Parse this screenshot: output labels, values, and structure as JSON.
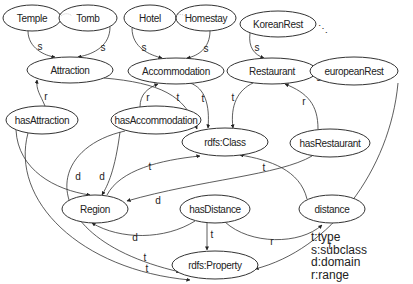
{
  "diagram": {
    "type": "rdf-ontology-graph",
    "nodes": [
      {
        "id": "temple",
        "label": "Temple",
        "cx": 32,
        "cy": 18,
        "rx": 29,
        "ry": 13
      },
      {
        "id": "tomb",
        "label": "Tomb",
        "cx": 88,
        "cy": 18,
        "rx": 29,
        "ry": 13
      },
      {
        "id": "hotel",
        "label": "Hotel",
        "cx": 150,
        "cy": 18,
        "rx": 26,
        "ry": 13
      },
      {
        "id": "homestay",
        "label": "Homestay",
        "cx": 206,
        "cy": 18,
        "rx": 30,
        "ry": 13
      },
      {
        "id": "koreanrest",
        "label": "KoreanRest",
        "cx": 278,
        "cy": 24,
        "rx": 38,
        "ry": 13
      },
      {
        "id": "attraction",
        "label": "Attraction",
        "cx": 70,
        "cy": 70,
        "rx": 43,
        "ry": 13
      },
      {
        "id": "accommodation",
        "label": "Accommodation",
        "cx": 176,
        "cy": 71,
        "rx": 48,
        "ry": 13
      },
      {
        "id": "restaurant",
        "label": "Restaurant",
        "cx": 272,
        "cy": 71,
        "rx": 45,
        "ry": 13
      },
      {
        "id": "europeanrest",
        "label": "europeanRest",
        "cx": 354,
        "cy": 71,
        "rx": 44,
        "ry": 14
      },
      {
        "id": "hasattraction",
        "label": "hasAttraction",
        "cx": 42,
        "cy": 120,
        "rx": 36,
        "ry": 14
      },
      {
        "id": "hasaccommodation",
        "label": "hasAccommodation",
        "cx": 156,
        "cy": 120,
        "rx": 45,
        "ry": 14
      },
      {
        "id": "rdfsclass",
        "label": "rdfs:Class",
        "cx": 225,
        "cy": 142,
        "rx": 43,
        "ry": 14
      },
      {
        "id": "hasrestaurant",
        "label": "hasRestaurant",
        "cx": 330,
        "cy": 143,
        "rx": 40,
        "ry": 14
      },
      {
        "id": "region",
        "label": "Region",
        "cx": 95,
        "cy": 209,
        "rx": 33,
        "ry": 14
      },
      {
        "id": "hasdistance",
        "label": "hasDistance",
        "cx": 215,
        "cy": 209,
        "rx": 35,
        "ry": 14
      },
      {
        "id": "distance",
        "label": "distance",
        "cx": 332,
        "cy": 209,
        "rx": 33,
        "ry": 14
      },
      {
        "id": "rdfsproperty",
        "label": "rdfs:Property",
        "cx": 215,
        "cy": 265,
        "rx": 43,
        "ry": 14
      }
    ],
    "edges": [
      {
        "from": "temple",
        "to": "attraction",
        "label": "s",
        "d": "M28,31 C28,48 45,56 55,57",
        "lx": 40,
        "ly": 46
      },
      {
        "from": "tomb",
        "to": "attraction",
        "label": "s",
        "d": "M110,27 C110,45 95,54 78,57",
        "lx": 103,
        "ly": 47
      },
      {
        "from": "hotel",
        "to": "accommodation",
        "label": "s",
        "d": "M132,28 C132,48 150,55 162,58",
        "lx": 144,
        "ly": 47
      },
      {
        "from": "homestay",
        "to": "accommodation",
        "label": "s",
        "d": "M210,31 C210,48 198,56 187,58",
        "lx": 206,
        "ly": 48
      },
      {
        "from": "koreanrest",
        "to": "restaurant",
        "label": "s",
        "d": "M250,33 C248,48 255,55 264,58",
        "lx": 257,
        "ly": 47
      },
      {
        "from": "europeanrest",
        "to": "restaurant",
        "label": "s",
        "d": "M310,72 L318,72",
        "lx": 319,
        "ly": 77
      },
      {
        "from": "hasattraction",
        "to": "attraction",
        "label": "r",
        "d": "M45,106 C40,94 36,90 37,80",
        "lx": 46,
        "ly": 96
      },
      {
        "from": "hasaccommodation",
        "to": "accommodation",
        "label": "r",
        "d": "M140,107 C140,94 148,88 158,84",
        "lx": 148,
        "ly": 97
      },
      {
        "from": "attraction",
        "to": "rdfsclass",
        "label": "t",
        "d": "M104,78 C160,83 185,95 197,129",
        "lx": 178,
        "ly": 97
      },
      {
        "from": "accommodation",
        "to": "rdfsclass",
        "label": "t",
        "d": "M190,83 C205,88 210,105 208,128",
        "lx": 203,
        "ly": 98
      },
      {
        "from": "restaurant",
        "to": "rdfsclass",
        "label": "t",
        "d": "M253,83 C238,90 230,105 233,128",
        "lx": 233,
        "ly": 97
      },
      {
        "from": "hasrestaurant",
        "to": "restaurant",
        "label": "r",
        "d": "M318,129 C318,105 308,93 285,84",
        "lx": 304,
        "ly": 101
      },
      {
        "from": "hasattraction",
        "to": "region",
        "label": "d",
        "d": "M16,130 C18,170 55,190 90,195",
        "lx": 78,
        "ly": 176
      },
      {
        "from": "hasaccommodation",
        "to": "region",
        "label": "d",
        "d": "M120,132 C115,170 108,185 102,195",
        "lx": 102,
        "ly": 176
      },
      {
        "from": "hasaccommodation",
        "to": "rdfsproperty",
        "label": "t",
        "d": "M125,131 C40,150 40,240 180,272",
        "lx": 145,
        "ly": 257
      },
      {
        "from": "hasattraction",
        "to": "rdfsproperty",
        "label": "t",
        "d": "M28,133 C10,200 80,270 190,280",
        "lx": 147,
        "ly": 268
      },
      {
        "from": "hasrestaurant",
        "to": "region",
        "label": "d",
        "d": "M312,156 C280,175 200,180 127,201",
        "lx": 158,
        "ly": 200
      },
      {
        "from": "hasdistance",
        "to": "region",
        "label": "d",
        "d": "M195,221 C165,240 120,240 92,223",
        "lx": 135,
        "ly": 237
      },
      {
        "from": "region",
        "to": "rdfsclass",
        "label": "t",
        "d": "M107,195 C120,170 160,160 200,156",
        "lx": 150,
        "ly": 166
      },
      {
        "from": "distance",
        "to": "rdfsclass",
        "label": "t",
        "d": "M307,199 C300,170 270,160 240,155",
        "lx": 264,
        "ly": 167
      },
      {
        "from": "hasdistance",
        "to": "rdfsproperty",
        "label": "t",
        "d": "M207,223 L207,250",
        "lx": 212,
        "ly": 234
      },
      {
        "from": "hasdistance",
        "to": "distance",
        "label": "r",
        "d": "M225,222 C250,245 300,245 322,225",
        "lx": 272,
        "ly": 241
      },
      {
        "from": "europeanrest",
        "to": "rdfsproperty",
        "label": "t",
        "d": "M398,83 C390,170 330,250 255,269",
        "lx": 330,
        "ly": 245
      }
    ],
    "ellipsis": "⋰"
  },
  "legend": {
    "items": [
      {
        "key": "t",
        "meaning": "type",
        "text": "t:type"
      },
      {
        "key": "s",
        "meaning": "subclass",
        "text": "s:subclass"
      },
      {
        "key": "d",
        "meaning": "domain",
        "text": "d:domain"
      },
      {
        "key": "r",
        "meaning": "range",
        "text": "r:range"
      }
    ]
  }
}
